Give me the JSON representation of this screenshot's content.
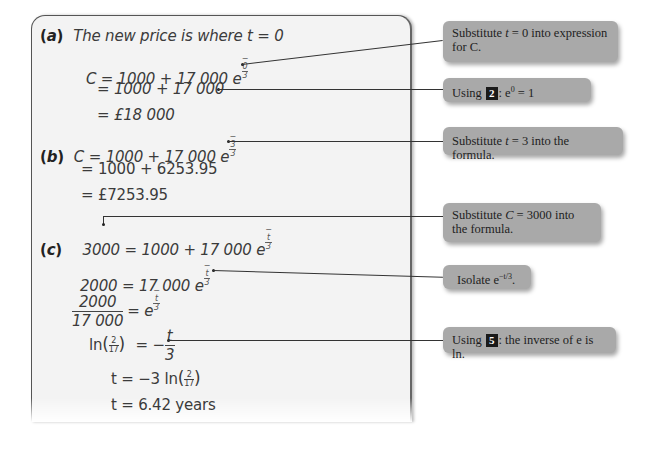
{
  "worked_solution": {
    "part_a": {
      "label": "(a)",
      "intro": "The new price is where t = 0",
      "step1_lhs": "C = 1000 + 17 000 e",
      "step1_exp_num": "0",
      "step1_exp_den": "3",
      "step2": "= 1000 + 17 000",
      "step3": "= £18 000"
    },
    "part_b": {
      "label": "(b)",
      "step1_lhs": "C = 1000 + 17 000 e",
      "step1_exp_num": "3",
      "step1_exp_den": "3",
      "step2": "= 1000 + 6253.95",
      "step3": "= £7253.95"
    },
    "part_c": {
      "label": "(c)",
      "step1_lhs": "3000",
      "step1_rhs": "= 1000 + 17 000 e",
      "exp_num": "t",
      "exp_den": "3",
      "step2_lhs": "2000",
      "step2_rhs": "= 17 000 e",
      "step3_num": "2000",
      "step3_den": "17 000",
      "step3_rhs": "= e",
      "step4_ln": "ln",
      "step4_frac_num": "2",
      "step4_frac_den": "17",
      "step4_rhs_eq": "= −",
      "step4_rhs_num": "t",
      "step4_rhs_den": "3",
      "step5_lhs": "t = −3 ln",
      "step6": "t = 6.42 years"
    }
  },
  "callouts": [
    {
      "id": "c1",
      "text_before": "Substitute ",
      "var": "t",
      "text_after": " = 0 into expression for C."
    },
    {
      "id": "c2",
      "text_before": "Using ",
      "badge": "2",
      "text_after": ": e",
      "sup": "0",
      "text_end": " = 1"
    },
    {
      "id": "c3",
      "text_before": "Substitute ",
      "var": "t",
      "text_after": " = 3 into the formula."
    },
    {
      "id": "c4",
      "text_before": "Substitute ",
      "var": "C",
      "text_after": " = 3000 into the formula."
    },
    {
      "id": "c5",
      "text_before": "Isolate e",
      "sup": "−t/3",
      "text_after": "."
    },
    {
      "id": "c6",
      "text_before": "Using ",
      "badge": "5",
      "text_after": ": the inverse of e is ln."
    }
  ],
  "colors": {
    "panel_bg": "#f3f3f3",
    "callout_bg": "#a9a9a9",
    "badge_bg": "#1a1a1a",
    "text": "#3b3b3b"
  }
}
